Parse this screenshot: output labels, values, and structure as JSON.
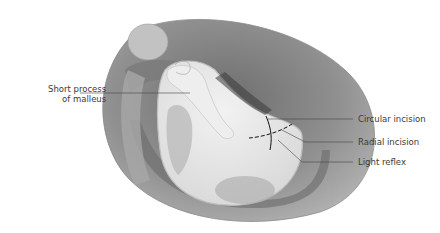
{
  "figure": {
    "labels": {
      "short_process_line1": "Short process",
      "short_process_line2": "of malleus",
      "circular_incision": "Circular incision",
      "radial_incision": "Radial incision",
      "light_reflex": "Light reflex"
    },
    "colors": {
      "background": "#ffffff",
      "outer_canal": "#8e8e8e",
      "outer_canal_light": "#b8b8b8",
      "membrane": "#e8e8e8",
      "membrane_rim": "#f4f4f4",
      "malleus": "#ececec",
      "shadow": "#5a5a5a",
      "leader_line": "#333333",
      "incision": "#111111"
    }
  }
}
